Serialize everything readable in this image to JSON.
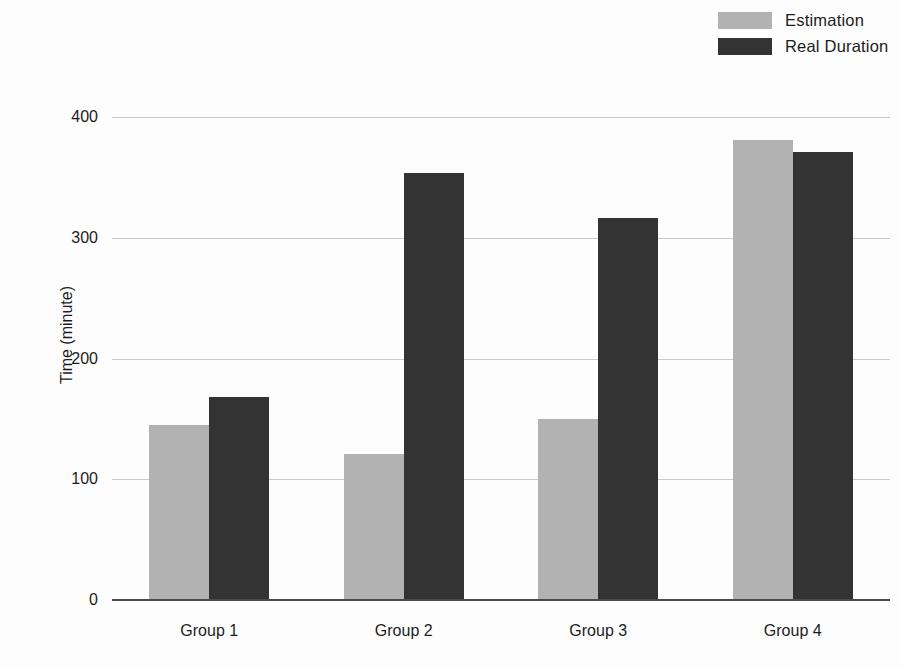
{
  "chart_data": {
    "type": "bar",
    "title": "",
    "subtitle": "",
    "xlabel": "",
    "ylabel": "Time (minute)",
    "categories": [
      "Group 1",
      "Group 2",
      "Group 3",
      "Group 4"
    ],
    "series": [
      {
        "name": "Estimation",
        "color": "#b2b2b2",
        "values": [
          145,
          121,
          150,
          381
        ]
      },
      {
        "name": "Real Duration",
        "color": "#333333",
        "values": [
          168,
          354,
          316,
          371
        ]
      }
    ],
    "ylim": [
      0,
      400
    ],
    "yticks": [
      0,
      100,
      200,
      300,
      400
    ],
    "ytick_labels": [
      "0",
      "100",
      "200",
      "300",
      "400"
    ],
    "grid": true,
    "grid_axis": "y",
    "legend_position": "top-right",
    "background_color": "#fdfdfd",
    "gridline_color": "#c9c9c9",
    "axis_color": "#4a4a4a"
  }
}
